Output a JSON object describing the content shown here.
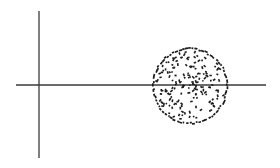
{
  "diagram": {
    "colors": {
      "axis": "#3a3a3a",
      "dots": "#1a1a1a",
      "background": "#ffffff"
    },
    "axes": {
      "horizontal": {
        "x1": 16,
        "x2": 266,
        "y": 85
      },
      "vertical": {
        "x": 39,
        "y1": 11,
        "y2": 158
      }
    },
    "cluster": {
      "cx": 190,
      "cy": 86,
      "r": 38,
      "dot_count": 230
    },
    "inner_arc": {
      "cx": 190,
      "cy": 84,
      "r": 9
    }
  }
}
